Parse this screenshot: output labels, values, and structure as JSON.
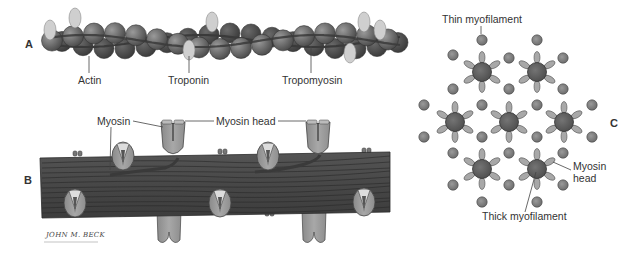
{
  "colors": {
    "actin_bead": "#6e6e6e",
    "actin_bead_back": "#4a4a4a",
    "actin_bead_stroke": "#333333",
    "troponin": "#cfcfcf",
    "tropomyosin": "#3a3a3a",
    "thick_bar": "#4c4c4c",
    "thick_bar_line": "#2a2a2a",
    "myosin_head": "#9a9a9a",
    "myosin_head_light": "#bdbdbd",
    "thick_core": "#5e5e5e",
    "thin_dot": "#7c7c7c",
    "head_petal": "#a8a8a8",
    "leader": "#444444"
  },
  "panel_a": {
    "letter": "A",
    "labels": {
      "actin": "Actin",
      "troponin": "Troponin",
      "tropomyosin": "Tropomyosin"
    }
  },
  "panel_b": {
    "letter": "B",
    "labels": {
      "myosin": "Myosin",
      "myosin_head": "Myosin head"
    },
    "signature": "JOHN M. BECK"
  },
  "panel_c": {
    "letter": "C",
    "labels": {
      "thin_myofilament": "Thin myofilament",
      "thick_myofilament": "Thick myofilament",
      "myosin_head": "Myosin\nhead"
    },
    "thick_filaments": [
      [
        482,
        72
      ],
      [
        537,
        72
      ],
      [
        455,
        122
      ],
      [
        509,
        122
      ],
      [
        564,
        122
      ],
      [
        482,
        169
      ],
      [
        537,
        169
      ]
    ],
    "thin_filaments": [
      [
        482,
        40
      ],
      [
        537,
        40
      ],
      [
        453,
        55
      ],
      [
        509,
        58
      ],
      [
        563,
        58
      ],
      [
        453,
        89
      ],
      [
        509,
        89
      ],
      [
        563,
        89
      ],
      [
        424,
        105
      ],
      [
        482,
        105
      ],
      [
        537,
        105
      ],
      [
        592,
        105
      ],
      [
        424,
        137
      ],
      [
        482,
        137
      ],
      [
        537,
        137
      ],
      [
        592,
        137
      ],
      [
        453,
        153
      ],
      [
        509,
        153
      ],
      [
        563,
        153
      ],
      [
        453,
        185
      ],
      [
        509,
        185
      ],
      [
        563,
        185
      ],
      [
        482,
        202
      ],
      [
        537,
        202
      ]
    ]
  }
}
